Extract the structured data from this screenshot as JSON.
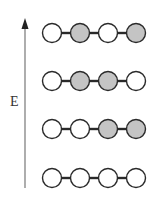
{
  "axis": {
    "label": "E",
    "direction": "up"
  },
  "colors": {
    "filled": "#c4c4c4",
    "empty": "#ffffff",
    "stroke": "#2a2a2a",
    "axis": "#777777"
  },
  "rows": [
    {
      "states": [
        0,
        1,
        0,
        1
      ]
    },
    {
      "states": [
        0,
        1,
        1,
        0
      ]
    },
    {
      "states": [
        0,
        0,
        1,
        1
      ]
    },
    {
      "states": [
        0,
        0,
        0,
        0
      ]
    }
  ]
}
